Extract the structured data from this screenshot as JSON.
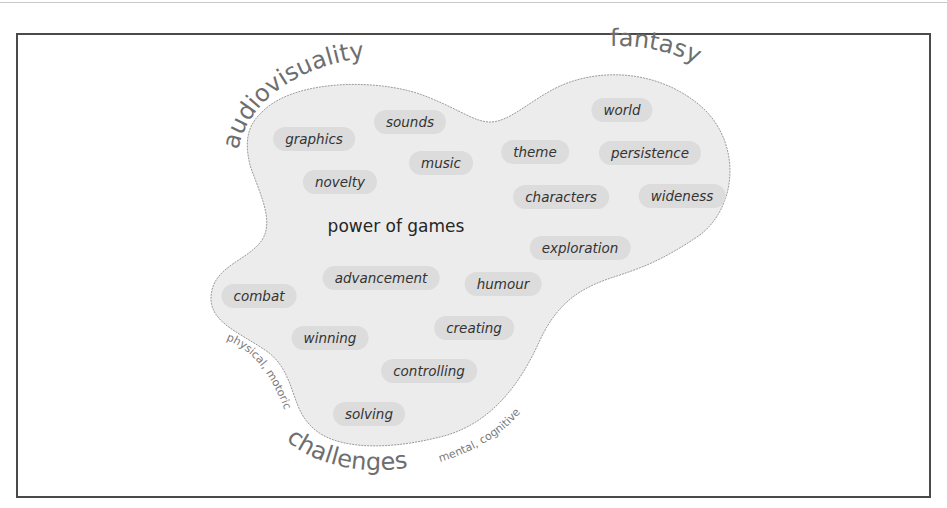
{
  "diagram": {
    "center_label": "power of games",
    "categories": {
      "audiovisuality": "audiovisuality",
      "fantasy": "fantasy",
      "challenges": "challenges",
      "physical": "physical, motoric",
      "mental": "mental, cognitive"
    },
    "items": [
      {
        "label": "sounds",
        "x": 410,
        "y": 122
      },
      {
        "label": "graphics",
        "x": 314,
        "y": 139
      },
      {
        "label": "music",
        "x": 441,
        "y": 163
      },
      {
        "label": "novelty",
        "x": 340,
        "y": 182
      },
      {
        "label": "world",
        "x": 622,
        "y": 110
      },
      {
        "label": "theme",
        "x": 535,
        "y": 152
      },
      {
        "label": "persistence",
        "x": 650,
        "y": 153
      },
      {
        "label": "characters",
        "x": 561,
        "y": 197
      },
      {
        "label": "wideness",
        "x": 682,
        "y": 196
      },
      {
        "label": "exploration",
        "x": 580,
        "y": 248
      },
      {
        "label": "advancement",
        "x": 381,
        "y": 278
      },
      {
        "label": "humour",
        "x": 503,
        "y": 284
      },
      {
        "label": "combat",
        "x": 259,
        "y": 296
      },
      {
        "label": "creating",
        "x": 474,
        "y": 328
      },
      {
        "label": "winning",
        "x": 330,
        "y": 338
      },
      {
        "label": "controlling",
        "x": 429,
        "y": 371
      },
      {
        "label": "solving",
        "x": 369,
        "y": 414
      }
    ],
    "colors": {
      "blob_fill": "#ececec",
      "blob_stroke": "#9a9a9a",
      "pill_fill": "#dcdcdc",
      "text": "#333333",
      "category_text": "#6e6e6e",
      "frame": "#4a4a4a"
    }
  }
}
